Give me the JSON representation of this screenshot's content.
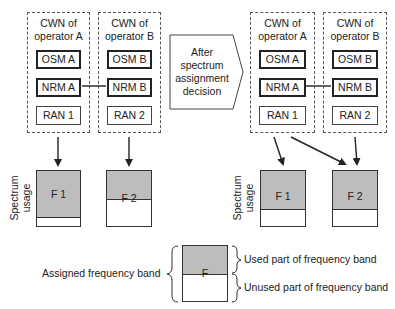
{
  "before": {
    "cwn_a": {
      "title_line1": "CWN of",
      "title_line2": "operator A",
      "osm": "OSM A",
      "nrm": "NRM A",
      "ran": "RAN 1"
    },
    "cwn_b": {
      "title_line1": "CWN of",
      "title_line2": "operator B",
      "osm": "OSM B",
      "nrm": "NRM B",
      "ran": "RAN 2"
    },
    "spectrum_label_line1": "Spectrum",
    "spectrum_label_line2": "usage",
    "bands": [
      {
        "label": "F 1",
        "used_fraction": 0.82
      },
      {
        "label": "F 2",
        "used_fraction": 0.5
      }
    ]
  },
  "transition": {
    "line1": "After",
    "line2": "spectrum",
    "line3": "assignment",
    "line4": "decision"
  },
  "after": {
    "cwn_a": {
      "title_line1": "CWN of",
      "title_line2": "operator A",
      "osm": "OSM A",
      "nrm": "NRM A",
      "ran": "RAN 1"
    },
    "cwn_b": {
      "title_line1": "CWN of",
      "title_line2": "operator B",
      "osm": "OSM B",
      "nrm": "NRM B",
      "ran": "RAN 2"
    },
    "spectrum_label_line1": "Spectrum",
    "spectrum_label_line2": "usage",
    "bands": [
      {
        "label": "F 1",
        "used_fraction": 0.65
      },
      {
        "label": "F 2",
        "used_fraction": 0.65
      }
    ]
  },
  "legend": {
    "band_label": "F",
    "assigned": "Assigned frequency band",
    "used": "Used part of frequency band",
    "unused": "Unused part of frequency band"
  },
  "colors": {
    "used_fill": "#bdbdbd",
    "line": "#222222"
  }
}
